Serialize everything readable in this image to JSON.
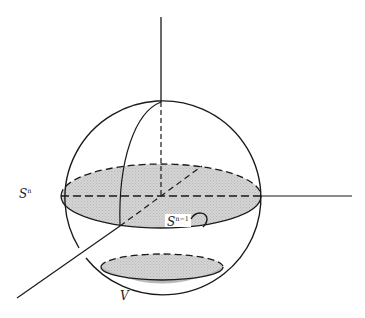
{
  "diagram": {
    "labels": {
      "sphere": {
        "base": "S",
        "sup": "n"
      },
      "equator": {
        "base": "S",
        "sup": "n−1"
      },
      "cap": {
        "base": "V"
      }
    },
    "colors": {
      "stroke": "#1a1a1a",
      "fill": "#cfcfcf",
      "background": "#ffffff"
    }
  }
}
